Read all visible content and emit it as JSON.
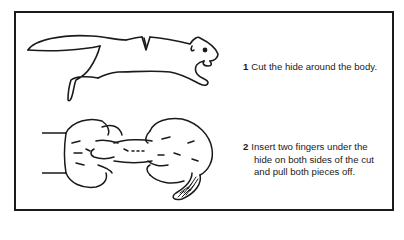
{
  "figure": {
    "border_color": "#1a1a1a",
    "background": "#ffffff"
  },
  "steps": [
    {
      "number": "1",
      "text": "Cut the hide around the body.",
      "illustration": "squirrel-with-cut-icon"
    },
    {
      "number": "2",
      "lines": [
        "Insert two fingers under the",
        "hide on both sides of the cut",
        "and pull both pieces off."
      ],
      "illustration": "hands-pulling-hide-icon"
    }
  ]
}
